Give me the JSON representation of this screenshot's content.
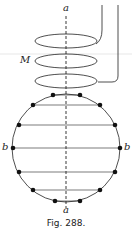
{
  "figure": {
    "caption": "Fig. 288.",
    "labels": {
      "axis_top": "a",
      "axis_bottom": "a",
      "coil": "M",
      "left": "b",
      "right": "b"
    },
    "dot_count": 14,
    "horizontal_chords": 6
  }
}
